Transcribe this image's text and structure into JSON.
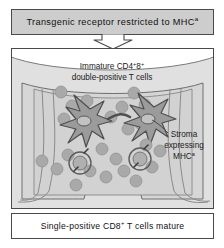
{
  "figure": {
    "title_box": {
      "text_main": "Transgenic receptor restricted to MHC",
      "text_sup": "a",
      "bg_color": "#cdcdcd",
      "border_color": "#4a4a4a"
    },
    "flow_arrow": {
      "icon": "arrow-down-icon",
      "direction": "down",
      "fill": "#ffffff",
      "stroke": "#4a4a4a"
    },
    "diagram": {
      "scene": "thymus-cortex-cross-section",
      "capsule_fill": "#e3e3e3",
      "cortex_fill": "#d8d8d8",
      "medulla_fill": "#cfcfcf",
      "outline_color": "#6e6e6e",
      "labels": [
        {
          "id": "immature-t-cell-label",
          "line1": "Immature CD4",
          "sup1": "+",
          "line1b": "8",
          "sup2": "+",
          "line2": "double-positive T cells"
        },
        {
          "id": "stroma-label",
          "line1": "Stroma",
          "line2": "expressing",
          "line3": "MHC",
          "sup": "a"
        }
      ],
      "stromal_cells": {
        "count": 2,
        "shape": "star",
        "fill": "#9a9a9a",
        "stroke": "#4f4f4f",
        "nucleus_fill": "#b8b8b8"
      },
      "thymocytes": {
        "fill": "#a8a8a8",
        "stroke": "#8c8c8c",
        "description": "round double-positive T cells"
      },
      "selected_cells": {
        "count": 2,
        "ring_stroke": "#5c5c5c",
        "description": "circled cells undergoing positive selection"
      }
    },
    "footer_box": {
      "text_a": "Single-positive CD8",
      "text_sup": "+",
      "text_b": " T cells mature",
      "border_color": "#4a4a4a",
      "bg_color": "#ffffff"
    }
  }
}
